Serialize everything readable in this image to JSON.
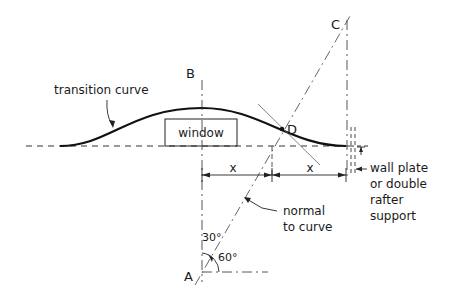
{
  "labels": {
    "transition_curve": "transition curve",
    "window": "window",
    "point_b": "B",
    "point_c": "C",
    "point_d": "D",
    "point_a": "A",
    "dim_left": "x",
    "dim_right": "x",
    "normal_line1": "normal",
    "normal_line2": "to curve",
    "wall_line1": "wall plate",
    "wall_line2": "or double",
    "wall_line3": "rafter",
    "wall_line4": "support",
    "angle_30": "30°",
    "angle_60": "60°"
  },
  "colors": {
    "ink": "#1a1a1a",
    "construction": "#555555",
    "background": "#ffffff"
  }
}
